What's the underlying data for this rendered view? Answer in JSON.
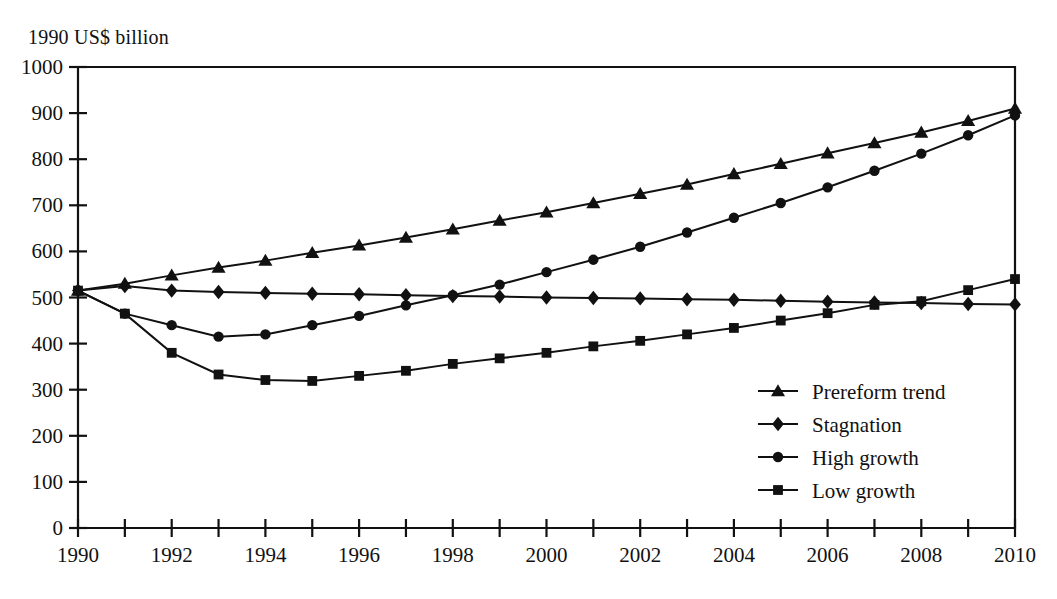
{
  "chart_data": {
    "type": "line",
    "title": "1990 US$ billion",
    "xlabel": "",
    "ylabel": "1990 US$ billion",
    "xlim": [
      1990,
      2010
    ],
    "ylim": [
      0,
      1000
    ],
    "ytick_step": 100,
    "xtick_step": 1,
    "xlabel_step": 2,
    "grid": false,
    "legend_position": "lower-right",
    "yticks": [
      "0",
      "100",
      "200",
      "300",
      "400",
      "500",
      "600",
      "700",
      "800",
      "900",
      "1000"
    ],
    "xticks": [
      "1990",
      "1991",
      "1992",
      "1993",
      "1994",
      "1995",
      "1996",
      "1997",
      "1998",
      "1999",
      "2000",
      "2001",
      "2002",
      "2003",
      "2004",
      "2005",
      "2006",
      "2007",
      "2008",
      "2009",
      "2010"
    ],
    "xtick_labels": [
      "1990",
      "1992",
      "1994",
      "1996",
      "1998",
      "2000",
      "2002",
      "2004",
      "2006",
      "2008",
      "2010"
    ],
    "x": [
      1990,
      1991,
      1992,
      1993,
      1994,
      1995,
      1996,
      1997,
      1998,
      1999,
      2000,
      2001,
      2002,
      2003,
      2004,
      2005,
      2006,
      2007,
      2008,
      2009,
      2010
    ],
    "series": [
      {
        "name": "Prereform trend",
        "marker": "triangle",
        "values": [
          515,
          530,
          548,
          565,
          580,
          597,
          613,
          630,
          648,
          667,
          685,
          705,
          725,
          745,
          768,
          790,
          813,
          835,
          858,
          883,
          910
        ]
      },
      {
        "name": "Stagnation",
        "marker": "diamond",
        "values": [
          515,
          525,
          515,
          512,
          510,
          508,
          507,
          505,
          503,
          502,
          500,
          499,
          498,
          496,
          495,
          493,
          491,
          489,
          488,
          486,
          485
        ]
      },
      {
        "name": "High growth",
        "marker": "circle",
        "values": [
          515,
          465,
          440,
          415,
          420,
          440,
          460,
          483,
          505,
          528,
          555,
          582,
          610,
          641,
          673,
          705,
          739,
          775,
          812,
          852,
          895
        ]
      },
      {
        "name": "Low growth",
        "marker": "square",
        "values": [
          515,
          465,
          380,
          333,
          321,
          319,
          330,
          341,
          356,
          368,
          380,
          394,
          406,
          420,
          434,
          450,
          466,
          484,
          492,
          516,
          540
        ]
      }
    ]
  },
  "legend": {
    "entries": [
      {
        "label": "Prereform trend",
        "marker": "triangle"
      },
      {
        "label": "Stagnation",
        "marker": "diamond"
      },
      {
        "label": "High growth",
        "marker": "circle"
      },
      {
        "label": "Low growth",
        "marker": "square"
      }
    ]
  }
}
